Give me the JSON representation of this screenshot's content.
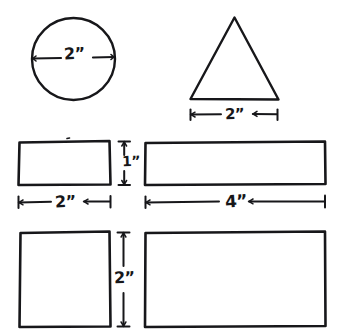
{
  "figure": {
    "style": "hand-drawn ink line drawing",
    "background_color": "#ffffff",
    "ink_color": "#17171a",
    "width": 337,
    "height": 335
  },
  "shapes": [
    {
      "id": "circle",
      "name": "circle",
      "row": 1,
      "column": "left",
      "dimension_lines": [
        "diameter"
      ]
    },
    {
      "id": "triangle",
      "name": "triangle",
      "row": 1,
      "column": "right",
      "dimension_lines": [
        "base-width"
      ]
    },
    {
      "id": "rect-small",
      "name": "rectangle-2x1",
      "row": 2,
      "column": "left",
      "dimension_lines": [
        "width",
        "height"
      ]
    },
    {
      "id": "rect-long",
      "name": "rectangle-4x1",
      "row": 2,
      "column": "right",
      "dimension_lines": [
        "width"
      ]
    },
    {
      "id": "square",
      "name": "square-2x2",
      "row": 3,
      "column": "left",
      "dimension_lines": [
        "height"
      ]
    },
    {
      "id": "rect-large",
      "name": "rectangle-4x2",
      "row": 3,
      "column": "right",
      "dimension_lines": []
    }
  ],
  "labels": {
    "circle_diameter": "2”",
    "triangle_base": "2”",
    "rect_small_width": "2”",
    "rect_small_height": "1”",
    "rect_long_width": "4”",
    "square_height": "2”"
  }
}
